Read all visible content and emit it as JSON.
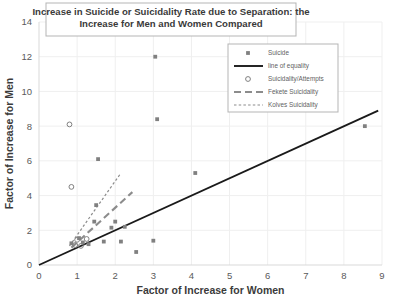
{
  "chart_data": {
    "type": "scatter",
    "title_line1": "Increase in Suicide or Suicidality Rate due to Separation: the",
    "title_line2": "Increase for Men and Women Compared",
    "xlabel": "Factor of Increase for Women",
    "ylabel": "Factor of Increase for Men",
    "xlim": [
      0,
      9
    ],
    "ylim": [
      0,
      14
    ],
    "xticks": [
      0,
      1,
      2,
      3,
      4,
      5,
      6,
      7,
      8,
      9
    ],
    "yticks": [
      0,
      2,
      4,
      6,
      8,
      10,
      12,
      14
    ],
    "grid": true,
    "legend_position": "top-right-inside",
    "legend": [
      {
        "label": "Suicide",
        "marker": "filled-square",
        "color": "#808080"
      },
      {
        "label": "line of equality",
        "marker": "solid-line",
        "color": "#1a1a1a"
      },
      {
        "label": "Suicidality/Attempts",
        "marker": "open-circle",
        "color": "#808080"
      },
      {
        "label": "Fekete Suicidality",
        "marker": "dashed-line",
        "color": "#8c8c8c"
      },
      {
        "label": "Kolves Suicidality",
        "marker": "dotted-line",
        "color": "#8c8c8c"
      }
    ],
    "series": [
      {
        "name": "Suicide",
        "marker": "filled-square",
        "color": "#808080",
        "points": [
          [
            3.05,
            12.0
          ],
          [
            3.1,
            8.4
          ],
          [
            1.55,
            6.1
          ],
          [
            4.1,
            5.3
          ],
          [
            8.55,
            8.0
          ],
          [
            3.0,
            1.4
          ],
          [
            1.5,
            3.45
          ],
          [
            2.0,
            2.5
          ],
          [
            2.25,
            2.2
          ],
          [
            1.45,
            2.5
          ],
          [
            1.9,
            2.15
          ],
          [
            1.05,
            1.55
          ],
          [
            1.7,
            1.35
          ],
          [
            2.15,
            1.35
          ],
          [
            1.3,
            1.2
          ],
          [
            0.85,
            1.25
          ],
          [
            1.15,
            1.3
          ],
          [
            2.55,
            0.75
          ]
        ]
      },
      {
        "name": "Suicidality/Attempts",
        "marker": "open-circle",
        "color": "#808080",
        "points": [
          [
            0.8,
            8.1
          ],
          [
            0.85,
            4.5
          ],
          [
            1.0,
            1.45
          ],
          [
            0.95,
            1.15
          ],
          [
            1.1,
            1.1
          ],
          [
            1.25,
            1.5
          ]
        ]
      }
    ],
    "reference_lines": [
      {
        "name": "line of equality",
        "style": "solid",
        "color": "#1a1a1a",
        "from": [
          0.0,
          0.0
        ],
        "to": [
          8.9,
          8.9
        ]
      },
      {
        "name": "Fekete Suicidality",
        "style": "dashed",
        "color": "#8c8c8c",
        "from": [
          0.85,
          1.0
        ],
        "to": [
          2.45,
          4.2
        ]
      },
      {
        "name": "Kolves Suicidality",
        "style": "dotted",
        "color": "#8c8c8c",
        "from": [
          0.8,
          1.1
        ],
        "to": [
          2.15,
          5.3
        ]
      }
    ]
  }
}
